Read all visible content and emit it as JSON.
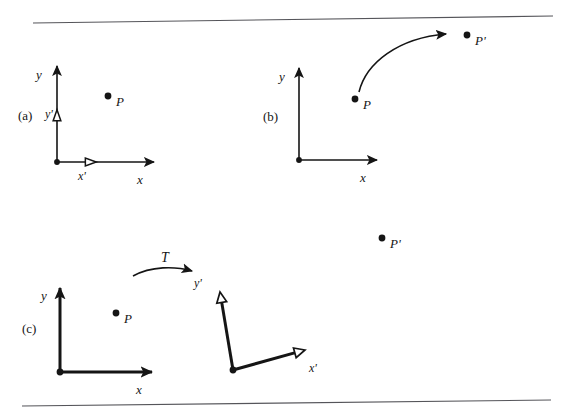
{
  "figure": {
    "background_color": "#ffffff",
    "ink_color": "#151515",
    "rule_color": "#55555a",
    "width": 573,
    "height": 415,
    "top_rule": {
      "x1": 33,
      "y1": 23,
      "x2": 553,
      "y2": 16
    },
    "bottom_rule": {
      "x1": 22,
      "y1": 406,
      "x2": 551,
      "y2": 400
    }
  },
  "panels": [
    {
      "id": "a",
      "label": "(a)",
      "label_pos": {
        "x": 18,
        "y": 109
      },
      "frame": {
        "origin": {
          "x": 57,
          "y": 162
        },
        "y_axis_tip": {
          "x": 57,
          "y": 66
        },
        "x_axis_tip": {
          "x": 154,
          "y": 162
        },
        "stroke_width": 1.6,
        "arrowhead": "filled"
      },
      "axis_labels": [
        {
          "name": "y",
          "text": "y",
          "x": 36,
          "y": 68
        },
        {
          "name": "x",
          "text": "x",
          "x": 137,
          "y": 173
        }
      ],
      "prime_markers": [
        {
          "name": "y-prime",
          "text": "y'",
          "label_x": 45,
          "label_y": 108,
          "tri_cx": 57,
          "tri_cy": 116,
          "dir": "up",
          "style": "hollow"
        },
        {
          "name": "x-prime",
          "text": "x'",
          "label_x": 78,
          "label_y": 170,
          "tri_cx": 90,
          "tri_cy": 162,
          "dir": "right",
          "style": "hollow"
        }
      ],
      "points": [
        {
          "name": "P",
          "text": "P",
          "dot_x": 108,
          "dot_y": 96,
          "label_x": 116,
          "label_y": 95
        }
      ]
    },
    {
      "id": "b",
      "label": "(b)",
      "label_pos": {
        "x": 263,
        "y": 110
      },
      "frame": {
        "origin": {
          "x": 299,
          "y": 160
        },
        "y_axis_tip": {
          "x": 299,
          "y": 68
        },
        "x_axis_tip": {
          "x": 377,
          "y": 160
        },
        "stroke_width": 1.6,
        "arrowhead": "filled"
      },
      "axis_labels": [
        {
          "name": "y",
          "text": "y",
          "x": 279,
          "y": 70
        },
        {
          "name": "x",
          "text": "x",
          "x": 360,
          "y": 171
        }
      ],
      "prime_markers": [],
      "points": [
        {
          "name": "P",
          "text": "P",
          "dot_x": 355,
          "dot_y": 99,
          "label_x": 363,
          "label_y": 98
        },
        {
          "name": "P-prime",
          "text": "P'",
          "dot_x": 467,
          "dot_y": 35,
          "label_x": 475,
          "label_y": 34
        }
      ],
      "motion_arrow": {
        "name": "curved-motion-arrow",
        "path": "M 359 92 C 366 63 398 38 446 34",
        "tip": {
          "x": 452,
          "y": 34
        },
        "stroke_width": 1.6
      }
    },
    {
      "id": "c",
      "label": "(c)",
      "label_pos": {
        "x": 22,
        "y": 322
      },
      "frame": {
        "origin": {
          "x": 60,
          "y": 372
        },
        "y_axis_tip": {
          "x": 60,
          "y": 288
        },
        "x_axis_tip": {
          "x": 152,
          "y": 372
        },
        "stroke_width": 3.0,
        "arrowhead": "filled"
      },
      "axis_labels": [
        {
          "name": "y",
          "text": "y",
          "x": 41,
          "y": 289
        },
        {
          "name": "x",
          "text": "x",
          "x": 136,
          "y": 383
        }
      ],
      "points": [
        {
          "name": "P",
          "text": "P",
          "dot_x": 116,
          "dot_y": 313,
          "label_x": 124,
          "label_y": 312
        }
      ],
      "transform_arrow": {
        "name": "transform-arrow-T",
        "label": "T",
        "label_x": 161,
        "label_y": 251,
        "path": "M 133 276 C 151 266 175 266 192 271",
        "tip": {
          "x": 198,
          "y": 272
        },
        "stroke_width": 1.6
      },
      "rotated_frame": {
        "origin": {
          "x": 233,
          "y": 370
        },
        "y_prime_end": {
          "x": 220,
          "y": 292
        },
        "x_prime_end": {
          "x": 305,
          "y": 350
        },
        "stroke_width": 3.0,
        "arrowhead": "hollow",
        "labels": [
          {
            "name": "y-prime",
            "text": "y'",
            "x": 194,
            "y": 277
          },
          {
            "name": "x-prime",
            "text": "x'",
            "x": 309,
            "y": 362
          }
        ]
      }
    }
  ],
  "standalone_points": [
    {
      "name": "P-prime",
      "text": "P'",
      "dot_x": 382,
      "dot_y": 238,
      "label_x": 390,
      "label_y": 237
    }
  ]
}
